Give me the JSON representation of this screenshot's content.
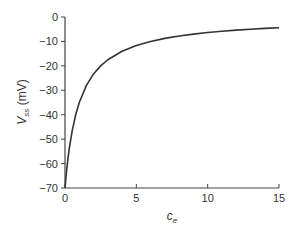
{
  "chart_data": {
    "type": "line",
    "title": "",
    "xlabel": "c_e",
    "ylabel": "V_ss (mV)",
    "xlim": [
      0,
      15
    ],
    "ylim": [
      -70,
      0
    ],
    "x_ticks": [
      0,
      5,
      10,
      15
    ],
    "y_ticks": [
      0,
      -10,
      -20,
      -30,
      -40,
      -50,
      -60,
      -70
    ],
    "x_tick_labels": [
      "0",
      "5",
      "10",
      "15"
    ],
    "y_tick_labels": [
      "0",
      "−10",
      "−20",
      "−30",
      "−40",
      "−50",
      "−60",
      "−70"
    ],
    "grid": false,
    "legend": null,
    "series": [
      {
        "name": "V_ss",
        "color": "#333333",
        "x": [
          0,
          0.1,
          0.2,
          0.3,
          0.5,
          0.75,
          1,
          1.5,
          2,
          2.5,
          3,
          4,
          5,
          6,
          7,
          8,
          9,
          10,
          11,
          12,
          13,
          14,
          15
        ],
        "y": [
          -70,
          -63.6,
          -58.3,
          -53.8,
          -46.7,
          -40.0,
          -35.0,
          -28.0,
          -23.3,
          -20.0,
          -17.5,
          -14.0,
          -11.7,
          -10.0,
          -8.75,
          -7.78,
          -7.0,
          -6.36,
          -5.83,
          -5.38,
          -5.0,
          -4.67,
          -4.38
        ]
      }
    ]
  },
  "labels": {
    "ylabel_main": "V",
    "ylabel_sub": "ss",
    "ylabel_unit": " (mV)",
    "xlabel_main": "c",
    "xlabel_sub": "e"
  }
}
